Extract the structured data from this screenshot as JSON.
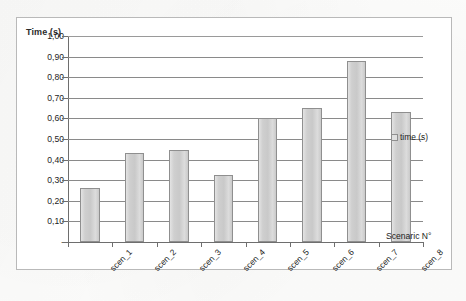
{
  "chart_data": {
    "type": "bar",
    "title": "",
    "categories": [
      "scen_1",
      "scen_2",
      "scen_3",
      "scen_4",
      "scen_5",
      "scen_6",
      "scen_7",
      "scen_8"
    ],
    "values": [
      0.26,
      0.43,
      0.445,
      0.325,
      0.6,
      0.65,
      0.88,
      0.63
    ],
    "series": [
      {
        "name": "time (s)",
        "values": [
          0.26,
          0.43,
          0.445,
          0.325,
          0.6,
          0.65,
          0.88,
          0.63
        ]
      }
    ],
    "xlabel": "Scenaric N°",
    "ylabel": "Time (s)",
    "ylim": [
      0,
      1.0
    ],
    "ytick_values": [
      0,
      0.1,
      0.2,
      0.3,
      0.4,
      0.5,
      0.6,
      0.7,
      0.8,
      0.9,
      1.0
    ],
    "ytick_labels": [
      "-",
      "0,10",
      "0,20",
      "0,30",
      "0,40",
      "0,50",
      "0,60",
      "0,70",
      "0,80",
      "0,90",
      "1,00"
    ],
    "grid": true,
    "legend_position": "right",
    "legend_entries": [
      "time (s)"
    ],
    "bar_fill_color": "#cfcfcf",
    "bar_border_color": "#8f8f8f",
    "gridline_color": "#8a8a8a",
    "axis_color": "#6e6e6e",
    "frame_color": "#b9b9b9",
    "background_color": "#ffffff"
  },
  "legend": {
    "swatch_icon": "legend-square-icon",
    "label": "time (s)"
  },
  "axes": {
    "y_title": "Time (s)",
    "x_title": "Scenaric N°"
  }
}
